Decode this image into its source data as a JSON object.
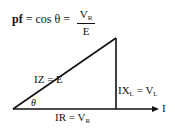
{
  "formula": {
    "lhs": "pf",
    "middle": " = cos θ  =",
    "numerator_main": "V",
    "numerator_sub": "R",
    "denominator": "E"
  },
  "triangle": {
    "hypotenuse_label": "IZ = E",
    "vertical_label_main": "IX",
    "vertical_label_sub": "L",
    "vertical_label_eq": " = V",
    "vertical_label_sub2": "L",
    "base_label_main": "IR = V",
    "base_label_sub": "R",
    "angle_label": "θ",
    "arrow_label": "I"
  },
  "colors": {
    "stroke": "#111111",
    "background": "#ffffff"
  }
}
